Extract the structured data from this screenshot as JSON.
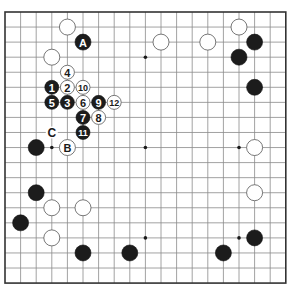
{
  "board": {
    "size": 19,
    "origin_x": 5,
    "origin_y": 12,
    "spacing_x": 15.6,
    "spacing_y": 15.06,
    "stone_radius": 8,
    "move_stone_radius": 7,
    "star_points": [
      [
        3,
        3
      ],
      [
        9,
        3
      ],
      [
        15,
        3
      ],
      [
        3,
        9
      ],
      [
        9,
        9
      ],
      [
        15,
        9
      ],
      [
        3,
        15
      ],
      [
        9,
        15
      ],
      [
        15,
        15
      ]
    ]
  },
  "stones": [
    {
      "color": "white",
      "col": 4,
      "row": 1,
      "label": ""
    },
    {
      "color": "black",
      "col": 5,
      "row": 2,
      "label": "A"
    },
    {
      "color": "white",
      "col": 3,
      "row": 3,
      "label": ""
    },
    {
      "color": "white",
      "col": 10,
      "row": 2,
      "label": ""
    },
    {
      "color": "white",
      "col": 13,
      "row": 2,
      "label": ""
    },
    {
      "color": "white",
      "col": 15,
      "row": 1,
      "label": ""
    },
    {
      "color": "black",
      "col": 16,
      "row": 2,
      "label": ""
    },
    {
      "color": "black",
      "col": 15,
      "row": 3,
      "label": ""
    },
    {
      "color": "black",
      "col": 16,
      "row": 5,
      "label": ""
    },
    {
      "color": "black",
      "col": 2,
      "row": 9,
      "label": ""
    },
    {
      "color": "white",
      "col": 4,
      "row": 9,
      "label": "B"
    },
    {
      "color": "white",
      "col": 16,
      "row": 9,
      "label": ""
    },
    {
      "color": "white",
      "col": 16,
      "row": 12,
      "label": ""
    },
    {
      "color": "black",
      "col": 2,
      "row": 12,
      "label": ""
    },
    {
      "color": "white",
      "col": 3,
      "row": 13,
      "label": ""
    },
    {
      "color": "white",
      "col": 5,
      "row": 13,
      "label": ""
    },
    {
      "color": "black",
      "col": 1,
      "row": 14,
      "label": ""
    },
    {
      "color": "white",
      "col": 3,
      "row": 15,
      "label": ""
    },
    {
      "color": "black",
      "col": 5,
      "row": 16,
      "label": ""
    },
    {
      "color": "black",
      "col": 8,
      "row": 16,
      "label": ""
    },
    {
      "color": "black",
      "col": 14,
      "row": 16,
      "label": ""
    },
    {
      "color": "black",
      "col": 16,
      "row": 15,
      "label": ""
    }
  ],
  "moves": [
    {
      "number": "1",
      "color": "black",
      "col": 3,
      "row": 5
    },
    {
      "number": "2",
      "color": "white",
      "col": 4,
      "row": 5
    },
    {
      "number": "3",
      "color": "black",
      "col": 4,
      "row": 6
    },
    {
      "number": "4",
      "color": "white",
      "col": 4,
      "row": 4
    },
    {
      "number": "5",
      "color": "black",
      "col": 3,
      "row": 6
    },
    {
      "number": "6",
      "color": "white",
      "col": 5,
      "row": 6
    },
    {
      "number": "7",
      "color": "black",
      "col": 5,
      "row": 7
    },
    {
      "number": "8",
      "color": "white",
      "col": 6,
      "row": 7
    },
    {
      "number": "9",
      "color": "black",
      "col": 6,
      "row": 6
    },
    {
      "number": "10",
      "color": "white",
      "col": 5,
      "row": 5
    },
    {
      "number": "11",
      "color": "black",
      "col": 5,
      "row": 8
    },
    {
      "number": "12",
      "color": "white",
      "col": 7,
      "row": 6
    }
  ],
  "point_labels": [
    {
      "text": "C",
      "col": 3,
      "row": 8
    }
  ]
}
